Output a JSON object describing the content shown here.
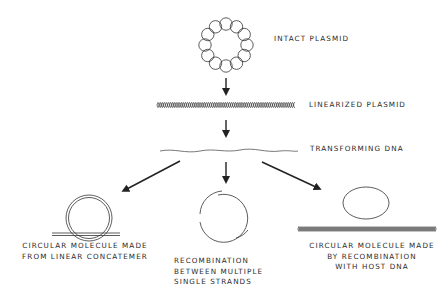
{
  "diagram": {
    "stages": [
      {
        "id": "intact",
        "label": "INTACT PLASMID"
      },
      {
        "id": "linear",
        "label": "LINEARIZED PLASMID"
      },
      {
        "id": "transforming",
        "label": "TRANSFORMING DNA"
      }
    ],
    "outcomes": [
      {
        "id": "concatemer",
        "lines": [
          "CIRCULAR MOLECULE MADE",
          "FROM LINEAR CONCATEMER"
        ]
      },
      {
        "id": "single-strands",
        "lines": [
          "RECOMBINATION",
          "BETWEEN MULTIPLE",
          "SINGLE STRANDS"
        ]
      },
      {
        "id": "host-dna",
        "lines": [
          "CIRCULAR MOLECULE MADE",
          "BY RECOMBINATION",
          "WITH HOST DNA"
        ]
      }
    ],
    "colors": {
      "ink": "#2a2a2a",
      "background": "#ffffff"
    }
  }
}
